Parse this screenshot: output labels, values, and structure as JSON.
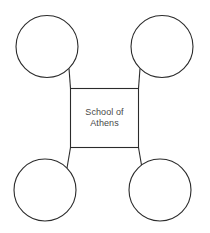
{
  "diagram": {
    "type": "concept-map",
    "background_color": "#ffffff",
    "stroke_color": "#2b2b2b",
    "text_color": "#494949",
    "canvas": {
      "width": 210,
      "height": 233
    },
    "center_node": {
      "shape": "rectangle",
      "label_lines": [
        "School of",
        "Athens"
      ],
      "label_line_1": "School of",
      "label_line_2": "Athens",
      "x": 70,
      "y": 88,
      "width": 69,
      "height": 60
    },
    "satellite_nodes": [
      {
        "id": "top-left",
        "shape": "circle",
        "label": "",
        "cx": 47,
        "cy": 46.5,
        "r": 31
      },
      {
        "id": "top-right",
        "shape": "circle",
        "label": "",
        "cx": 162,
        "cy": 46.5,
        "r": 31
      },
      {
        "id": "bottom-left",
        "shape": "circle",
        "label": "",
        "cx": 45,
        "cy": 190,
        "r": 31
      },
      {
        "id": "bottom-right",
        "shape": "circle",
        "label": "",
        "cx": 160,
        "cy": 190,
        "r": 31
      }
    ],
    "connectors": [
      {
        "id": "connector-top-left",
        "from": "top-left",
        "to": "center_node",
        "x1": 69,
        "y1": 68.5,
        "x2": 70.5,
        "y2": 88.5
      },
      {
        "id": "connector-top-right",
        "from": "top-right",
        "to": "center_node",
        "x1": 140,
        "y1": 68.5,
        "x2": 138.5,
        "y2": 88.5
      },
      {
        "id": "connector-bottom-left",
        "from": "bottom-left",
        "to": "center_node",
        "x1": 67,
        "y1": 168,
        "x2": 70.5,
        "y2": 147.5
      },
      {
        "id": "connector-bottom-right",
        "from": "bottom-right",
        "to": "center_node",
        "x1": 142,
        "y1": 168,
        "x2": 138.5,
        "y2": 147.5
      }
    ]
  }
}
